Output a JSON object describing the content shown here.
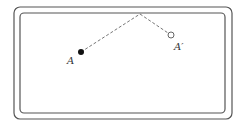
{
  "diagram": {
    "type": "billiard-reflection",
    "table": {
      "outer": {
        "x": 14,
        "y": 7,
        "w": 218,
        "h": 112,
        "r": 6
      },
      "inner": {
        "x": 20,
        "y": 13,
        "w": 205,
        "h": 100,
        "r": 4
      },
      "stroke": "#555555"
    },
    "ball_a": {
      "label": "A",
      "x": 81,
      "y": 52,
      "fill": "#111111"
    },
    "ball_a_prime": {
      "label": "A′",
      "x": 171,
      "y": 35,
      "fill": "#ffffff"
    },
    "bounce_point": {
      "x": 140,
      "y": 14
    },
    "path_style": "dashed"
  }
}
